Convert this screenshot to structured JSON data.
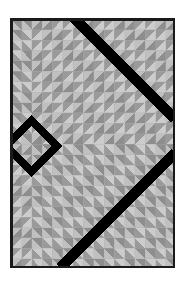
{
  "artwork": {
    "title": "Nested Chevron Diamond Tile Pattern",
    "medium": "geometric triangle-tile composition",
    "canvas": {
      "width": 191,
      "height": 283,
      "background_color": "#ffffff"
    },
    "frame": {
      "x": 10,
      "y": 18,
      "width": 165,
      "height": 250,
      "stroke_color": "#1a1a1a",
      "stroke_width": 2.5,
      "inner_fill": "#c9c9c9"
    },
    "grid": {
      "columns": 16,
      "rows": 24,
      "cell_width": 10.3125,
      "cell_height": 10.4166,
      "cell_split": "diagonal",
      "grout_color": "#b0b0b0",
      "grout_width": 0.35
    },
    "palette": {
      "light_gray": "#cccccc",
      "mid_light_gray": "#c0c0c0",
      "dark_gray": "#8e8e8e",
      "mid_dark_gray": "#9a9a9a",
      "black": "#000000",
      "frame": "#1a1a1a",
      "white": "#ffffff"
    },
    "motifs": {
      "chevron_origin": {
        "col": 2.0,
        "row": 12.2
      },
      "chevron_band_period": 2,
      "diamond_ring": {
        "center_x": 31,
        "center_y": 146,
        "outer_radius": 31,
        "inner_radius": 20,
        "color": "#000000",
        "inner_fill": "#cccccc"
      },
      "diagonal_stripes": [
        {
          "label": "upper-stripe",
          "x1": 74,
          "y1": 18,
          "x2": 175,
          "y2": 119,
          "width": 11,
          "color": "#000000"
        },
        {
          "label": "lower-stripe",
          "x1": 60,
          "y1": 268,
          "x2": 175,
          "y2": 153,
          "width": 11,
          "color": "#000000"
        }
      ]
    }
  },
  "labels": {
    "figure_caption": "",
    "alt_text": "Gray geometric tile pattern with black diamond and diagonal stripes"
  }
}
